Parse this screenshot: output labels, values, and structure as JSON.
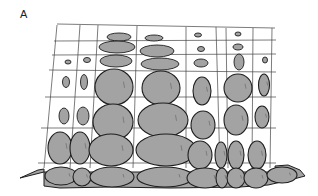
{
  "figure": {
    "panel_label": "A",
    "colors": {
      "fill": "#a3a3a3",
      "outline": "#1e1e1e",
      "grid": "#444444",
      "background": "#ffffff"
    },
    "grid": {
      "vertical_lines": [
        {
          "x1": 57,
          "y1": 25,
          "x2": 44,
          "y2": 168
        },
        {
          "x1": 80,
          "y1": 25,
          "x2": 70,
          "y2": 168
        },
        {
          "x1": 98,
          "y1": 25,
          "x2": 90,
          "y2": 168
        },
        {
          "x1": 137,
          "y1": 26,
          "x2": 133,
          "y2": 168
        },
        {
          "x1": 186,
          "y1": 27,
          "x2": 186,
          "y2": 168
        },
        {
          "x1": 216,
          "y1": 27,
          "x2": 220,
          "y2": 168
        },
        {
          "x1": 226,
          "y1": 28,
          "x2": 228,
          "y2": 168
        },
        {
          "x1": 253,
          "y1": 28,
          "x2": 252,
          "y2": 168
        },
        {
          "x1": 272,
          "y1": 28,
          "x2": 270,
          "y2": 168
        }
      ],
      "horizontal_lines": [
        {
          "x1": 57,
          "y1": 24,
          "x2": 275,
          "y2": 28
        },
        {
          "x1": 54,
          "y1": 41,
          "x2": 276,
          "y2": 40
        },
        {
          "x1": 52,
          "y1": 55,
          "x2": 276,
          "y2": 54
        },
        {
          "x1": 49,
          "y1": 70,
          "x2": 276,
          "y2": 72
        },
        {
          "x1": 45,
          "y1": 97,
          "x2": 276,
          "y2": 97
        },
        {
          "x1": 41,
          "y1": 128,
          "x2": 276,
          "y2": 128
        },
        {
          "x1": 38,
          "y1": 163,
          "x2": 276,
          "y2": 163
        }
      ]
    },
    "stones": [
      {
        "cx": 119,
        "cy": 37,
        "rx": 12,
        "ry": 4,
        "size": "small"
      },
      {
        "cx": 117,
        "cy": 47,
        "rx": 18,
        "ry": 6,
        "size": "small"
      },
      {
        "cx": 116,
        "cy": 61,
        "rx": 16,
        "ry": 6,
        "size": "small"
      },
      {
        "cx": 68,
        "cy": 62,
        "rx": 3,
        "ry": 2,
        "size": "small"
      },
      {
        "cx": 87,
        "cy": 60,
        "rx": 3.5,
        "ry": 2.5,
        "size": "small"
      },
      {
        "cx": 154,
        "cy": 38,
        "rx": 9,
        "ry": 3,
        "size": "small"
      },
      {
        "cx": 157,
        "cy": 51,
        "rx": 17,
        "ry": 6,
        "size": "small"
      },
      {
        "cx": 160,
        "cy": 64,
        "rx": 19,
        "ry": 6,
        "size": "small"
      },
      {
        "cx": 198,
        "cy": 35,
        "rx": 3.5,
        "ry": 2,
        "size": "small"
      },
      {
        "cx": 201,
        "cy": 49,
        "rx": 3.5,
        "ry": 2.5,
        "size": "small"
      },
      {
        "cx": 201,
        "cy": 63,
        "rx": 7,
        "ry": 4,
        "size": "small"
      },
      {
        "cx": 238,
        "cy": 34,
        "rx": 3,
        "ry": 2,
        "size": "small"
      },
      {
        "cx": 238,
        "cy": 47,
        "rx": 5,
        "ry": 3,
        "size": "small"
      },
      {
        "cx": 239,
        "cy": 62,
        "rx": 5,
        "ry": 8,
        "size": "small"
      },
      {
        "cx": 265,
        "cy": 60,
        "rx": 2.5,
        "ry": 3,
        "size": "small"
      },
      {
        "cx": 66,
        "cy": 82,
        "rx": 3.5,
        "ry": 5.5,
        "size": "small"
      },
      {
        "cx": 84,
        "cy": 82,
        "rx": 3.5,
        "ry": 7.5,
        "size": "small"
      },
      {
        "cx": 64,
        "cy": 116,
        "rx": 5,
        "ry": 8,
        "size": "small"
      },
      {
        "cx": 83,
        "cy": 116,
        "rx": 6,
        "ry": 9,
        "size": "small"
      },
      {
        "cx": 114,
        "cy": 87,
        "rx": 19,
        "ry": 18,
        "size": "large"
      },
      {
        "cx": 161,
        "cy": 88,
        "rx": 19,
        "ry": 17,
        "size": "large"
      },
      {
        "cx": 202,
        "cy": 91,
        "rx": 9,
        "ry": 14,
        "size": "medium"
      },
      {
        "cx": 238,
        "cy": 88,
        "rx": 14,
        "ry": 14,
        "size": "large"
      },
      {
        "cx": 264,
        "cy": 85,
        "rx": 5.5,
        "ry": 11,
        "size": "medium"
      },
      {
        "cx": 113,
        "cy": 122,
        "rx": 20,
        "ry": 18,
        "size": "large"
      },
      {
        "cx": 163,
        "cy": 120,
        "rx": 25,
        "ry": 17,
        "size": "large"
      },
      {
        "cx": 203,
        "cy": 125,
        "rx": 12,
        "ry": 14,
        "size": "large"
      },
      {
        "cx": 236,
        "cy": 120,
        "rx": 12,
        "ry": 15,
        "size": "large"
      },
      {
        "cx": 262,
        "cy": 117,
        "rx": 7,
        "ry": 11,
        "size": "medium"
      },
      {
        "cx": 60,
        "cy": 148,
        "rx": 12,
        "ry": 16,
        "size": "large"
      },
      {
        "cx": 80,
        "cy": 148,
        "rx": 10,
        "ry": 16,
        "size": "large"
      },
      {
        "cx": 111,
        "cy": 150,
        "rx": 22,
        "ry": 16,
        "size": "large"
      },
      {
        "cx": 166,
        "cy": 150,
        "rx": 30,
        "ry": 16,
        "size": "large"
      },
      {
        "cx": 200,
        "cy": 155,
        "rx": 12,
        "ry": 14,
        "size": "large"
      },
      {
        "cx": 221,
        "cy": 155,
        "rx": 6,
        "ry": 13,
        "size": "medium"
      },
      {
        "cx": 236,
        "cy": 155,
        "rx": 8,
        "ry": 14,
        "size": "medium"
      },
      {
        "cx": 257,
        "cy": 155,
        "rx": 9,
        "ry": 14,
        "size": "medium"
      },
      {
        "cx": 61,
        "cy": 176,
        "rx": 16,
        "ry": 9,
        "size": "large"
      },
      {
        "cx": 82,
        "cy": 177,
        "rx": 9,
        "ry": 9,
        "size": "medium"
      },
      {
        "cx": 112,
        "cy": 177,
        "rx": 22,
        "ry": 10,
        "size": "large"
      },
      {
        "cx": 165,
        "cy": 177,
        "rx": 28,
        "ry": 10,
        "size": "large"
      },
      {
        "cx": 205,
        "cy": 178,
        "rx": 18,
        "ry": 10,
        "size": "large"
      },
      {
        "cx": 222,
        "cy": 178,
        "rx": 6,
        "ry": 10,
        "size": "medium"
      },
      {
        "cx": 236,
        "cy": 178,
        "rx": 9,
        "ry": 10,
        "size": "medium"
      },
      {
        "cx": 256,
        "cy": 178,
        "rx": 12,
        "ry": 10,
        "size": "medium"
      },
      {
        "cx": 282,
        "cy": 175,
        "rx": 15,
        "ry": 8,
        "size": "medium"
      }
    ],
    "ground_path": "M20,178 L38,170 L44,169 L44,186 L60,188 L110,187 L170,188 L240,187 L268,185 L290,180 L305,176 L300,170 L288,165 L275,166 L276,172 L44,172 Z"
  }
}
